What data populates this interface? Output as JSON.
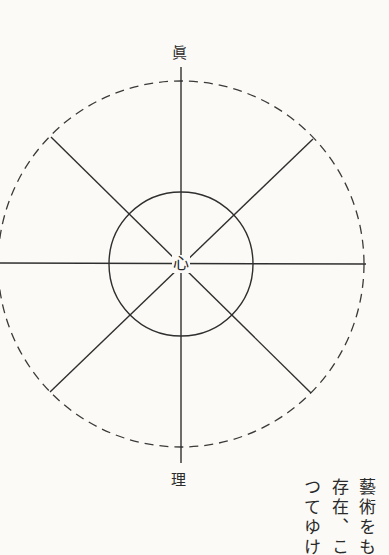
{
  "diagram": {
    "top_label": "眞",
    "bottom_label": "理",
    "center_label": "心",
    "center": {
      "x": 181,
      "y": 264
    },
    "outer_circle": {
      "radius": 184,
      "style": "dashed"
    },
    "inner_circle": {
      "radius": 72,
      "style": "solid"
    },
    "spokes": 8,
    "line_color": "#333333"
  },
  "side_text": {
    "columns": [
      "藝術をも",
      "存在、こ",
      "つてゆけ"
    ]
  }
}
